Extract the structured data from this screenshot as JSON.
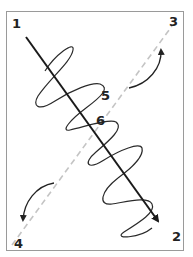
{
  "labels": {
    "p1": "1",
    "p2": "2",
    "p3": "3",
    "p4": "4",
    "p5": "5",
    "p6": "6"
  },
  "colors": {
    "frame": "#9a9a9a",
    "main_axis": "#1a1a1a",
    "dashed_axis": "#c4c4c4",
    "helix": "#2a2a2a",
    "rotation_arrows": "#222222"
  }
}
